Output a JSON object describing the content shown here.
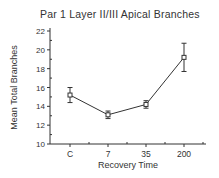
{
  "chart_data": {
    "type": "line",
    "title": "Par 1  Layer II/III  Apical  Branches",
    "xlabel": "Recovery  Time",
    "ylabel": "Mean  Total  Branches",
    "categories": [
      "C",
      "7",
      "35",
      "200"
    ],
    "series": [
      {
        "name": "Mean Total Branches",
        "values": [
          15.2,
          13.1,
          14.2,
          19.2
        ],
        "errors": [
          0.8,
          0.4,
          0.4,
          1.5
        ]
      }
    ],
    "ylim": [
      10,
      22
    ],
    "yticks": [
      10,
      12,
      14,
      16,
      18,
      20,
      22
    ],
    "grid": false,
    "legend": null,
    "marker": "open-square"
  }
}
